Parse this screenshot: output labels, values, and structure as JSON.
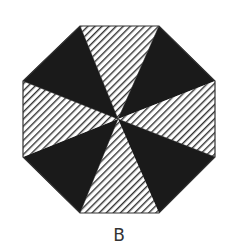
{
  "figure": {
    "caption": "B",
    "shape": "octagon",
    "center": [
      118,
      119
    ],
    "vertices": [
      [
        80,
        26
      ],
      [
        159,
        26
      ],
      [
        215,
        81
      ],
      [
        215,
        157
      ],
      [
        159,
        213
      ],
      [
        80,
        213
      ],
      [
        23,
        157
      ],
      [
        23,
        81
      ]
    ],
    "sectors": [
      {
        "name": "top",
        "fill": "hatched"
      },
      {
        "name": "upper-right",
        "fill": "solid"
      },
      {
        "name": "right",
        "fill": "hatched"
      },
      {
        "name": "lower-right",
        "fill": "solid"
      },
      {
        "name": "bottom",
        "fill": "hatched"
      },
      {
        "name": "lower-left",
        "fill": "solid"
      },
      {
        "name": "left",
        "fill": "hatched"
      },
      {
        "name": "upper-left",
        "fill": "solid"
      }
    ],
    "colors": {
      "solid": "#1a1a1a",
      "hatch_line": "#333333",
      "hatch_bg": "#ffffff",
      "outline": "#333333",
      "caption": "#333333"
    }
  }
}
